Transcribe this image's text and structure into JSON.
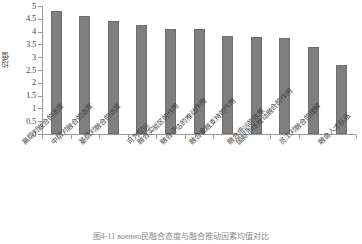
{
  "chart_data": {
    "type": "bar",
    "title": "",
    "xlabel": "",
    "ylabel": "均值",
    "ylim": [
      0,
      5
    ],
    "ytick_labels": [
      "5",
      "4.5",
      "4",
      "3.5",
      "3",
      "2.5",
      "2",
      "1.5",
      "1",
      "0.5",
      "0"
    ],
    "ytick_values": [
      5,
      4.5,
      4,
      3.5,
      3,
      2.5,
      2,
      1.5,
      1,
      0.5,
      0
    ],
    "grid": false,
    "legend": false,
    "bar_color": "#7f7f7f",
    "categories": [
      "高层对融合的态度",
      "中层对融合的态度",
      "基层对融合的态度",
      "可为空间",
      "融合实验区的作用",
      "融合评估的推动作用",
      "融合金融支持的作用",
      "融合培训的效果",
      "国际市场推动融合的作用",
      "员工对融合的理解",
      "融合人才队伍"
    ],
    "values": [
      4.8,
      4.6,
      4.43,
      4.25,
      4.1,
      4.09,
      3.83,
      3.79,
      3.77,
      3.38,
      2.71
    ]
  },
  "caption": {
    "text": "图4-11  военно民融合态度与融合推动因素均值对比"
  }
}
